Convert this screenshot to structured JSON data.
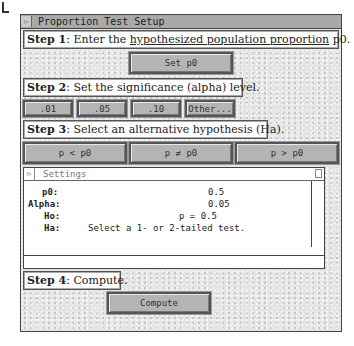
{
  "window": {
    "title": "Proportion Test Setup"
  },
  "step1": {
    "label": "Step 1",
    "text_before": ": Enter the ",
    "link": "hypothesized population proportion",
    "text_after": " p0.",
    "button": "Set p0"
  },
  "step2": {
    "label": "Step 2",
    "text": ": Set the significance (alpha) level.",
    "buttons": [
      ".01",
      ".05",
      ".10",
      "Other..."
    ]
  },
  "step3": {
    "label": "Step 3",
    "text": ": Select an alternative hypothesis (Ha).",
    "buttons": [
      "p < p0",
      "p ≠ p0",
      "p > p0"
    ]
  },
  "settings": {
    "title": "Settings",
    "rows": [
      {
        "label": "p0:",
        "value": "0.5"
      },
      {
        "label": "Alpha:",
        "value": "0.05"
      },
      {
        "label": "Ho:",
        "value": "p = 0.5"
      },
      {
        "label": "Ha:",
        "value": "Select a 1- or 2-tailed test."
      }
    ]
  },
  "step4": {
    "label": "Step 4",
    "text": ": Compute.",
    "button": "Compute"
  }
}
